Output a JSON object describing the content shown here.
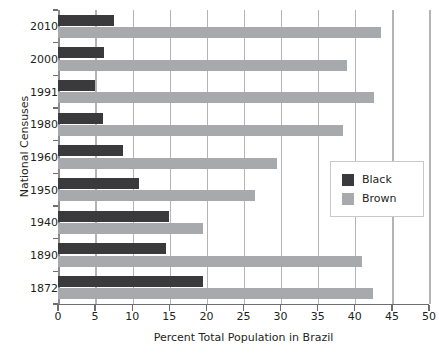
{
  "chart_data": {
    "type": "bar",
    "orientation": "horizontal",
    "title": "",
    "xlabel": "Percent Total Population in Brazil",
    "ylabel": "National Censuses",
    "xlim": [
      0,
      50
    ],
    "xticks": [
      0,
      5,
      10,
      15,
      20,
      25,
      30,
      35,
      40,
      45,
      50
    ],
    "xtick_labels": [
      "0",
      "5",
      "10",
      "15",
      "20",
      "25",
      "30",
      "35",
      "40",
      "45",
      "50"
    ],
    "grid": "vertical",
    "legend_position": "center-right",
    "categories": [
      "2010",
      "2000",
      "1991",
      "1980",
      "1960",
      "1950",
      "1940",
      "1890",
      "1872"
    ],
    "series": [
      {
        "name": "Black",
        "color": "#3a3a3c",
        "values": [
          7.6,
          6.2,
          5.0,
          6.0,
          8.8,
          10.9,
          14.9,
          14.6,
          19.5
        ]
      },
      {
        "name": "Brown",
        "color": "#a7a9ac",
        "values": [
          43.5,
          38.9,
          42.6,
          38.4,
          29.5,
          26.5,
          19.6,
          41.0,
          42.4
        ]
      }
    ]
  },
  "legend": {
    "entries": [
      {
        "label": "Black",
        "color": "#3a3a3c"
      },
      {
        "label": "Brown",
        "color": "#a7a9ac"
      }
    ]
  },
  "colors": {
    "black_series": "#3a3a3c",
    "brown_series": "#a7a9ac",
    "gridline": "#b4b4b4",
    "axis": "#6d6e71",
    "text": "#231f20",
    "background": "#ffffff"
  }
}
